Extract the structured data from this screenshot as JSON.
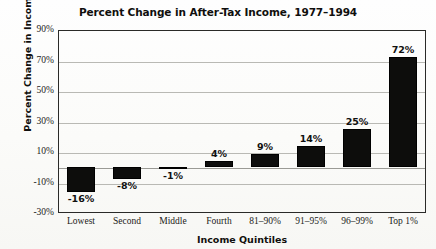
{
  "chart_data": {
    "type": "bar",
    "title": "Percent Change in After-Tax Income, 1977–1994",
    "xlabel": "Income Quintiles",
    "ylabel": "Percent Change in Income",
    "categories": [
      "Lowest",
      "Second",
      "Middle",
      "Fourth",
      "81–90%",
      "91–95%",
      "96–99%",
      "Top 1%"
    ],
    "values": [
      -16,
      -8,
      -1,
      4,
      9,
      14,
      25,
      72
    ],
    "value_labels": [
      "-16%",
      "-8%",
      "-1%",
      "4%",
      "9%",
      "14%",
      "25%",
      "72%"
    ],
    "ylim": [
      -30,
      90
    ],
    "ytick_values": [
      90,
      70,
      50,
      30,
      10,
      -10,
      -30
    ],
    "ytick_labels": [
      "90%",
      "70%",
      "50%",
      "30%",
      "10%",
      "-10%",
      "-30%"
    ],
    "grid": true,
    "legend": null,
    "bar_color": "#0d0d0c",
    "background_color": "#fdfdfb",
    "axis_color": "#2a2a28",
    "gridline_color": "#b9b9b4"
  }
}
